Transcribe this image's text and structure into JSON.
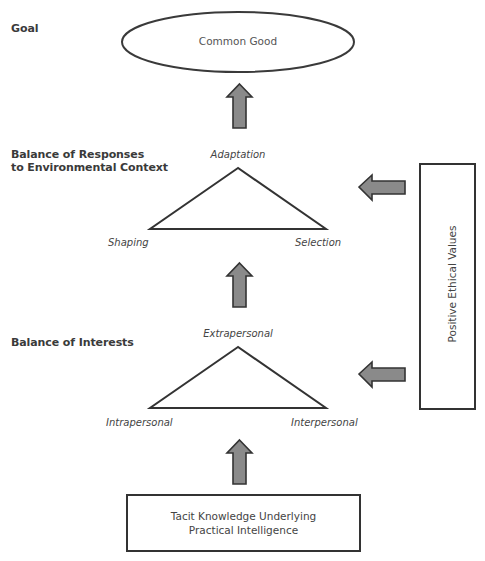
{
  "levels": {
    "goal": {
      "heading": "Goal",
      "node": "Common Good"
    },
    "responses": {
      "heading_line1": "Balance of Responses",
      "heading_line2": "to Environmental Context",
      "apex": "Adaptation",
      "left": "Shaping",
      "right": "Selection"
    },
    "interests": {
      "heading": "Balance of Interests",
      "apex": "Extrapersonal",
      "left": "Intrapersonal",
      "right": "Interpersonal"
    },
    "foundation": {
      "line1": "Tacit Knowledge Underlying",
      "line2": "Practical Intelligence"
    }
  },
  "side_box": {
    "label": "Positive Ethical Values"
  },
  "colors": {
    "stroke": "#3a3a3a",
    "arrow_fill": "#8a8a8a",
    "text": "#444444"
  }
}
